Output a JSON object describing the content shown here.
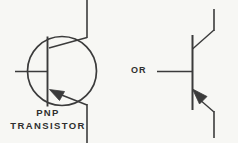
{
  "figure": {
    "kind": "schematic-diagram",
    "width": 238,
    "height": 143,
    "background_color": "#f7f7f4",
    "line_color": "#3b3b3b",
    "text_color": "#2f2f2f"
  },
  "labels": {
    "caption_line1": "PNP",
    "caption_line2": "TRANSISTOR",
    "alternative_connector": "OR"
  },
  "symbols": [
    {
      "name": "pnp-transistor-enclosed",
      "has_envelope_circle": true,
      "circle": {
        "cx": 62,
        "cy": 71,
        "r": 35
      },
      "base_bar": {
        "x": 47,
        "y1": 36,
        "y2": 107
      },
      "base_lead": {
        "x1": 15,
        "y1": 71,
        "x2": 47,
        "y2": 71
      },
      "collector": {
        "slant": {
          "x1": 50,
          "y1": 47,
          "x2": 87,
          "y2": 37
        },
        "lead": {
          "x": 87,
          "y1": 0,
          "y2": 37
        }
      },
      "emitter": {
        "slant": {
          "x1": 50,
          "y1": 95,
          "x2": 87,
          "y2": 105
        },
        "lead": {
          "x": 87,
          "y1": 105,
          "y2": 143
        },
        "arrow_points_toward": "base"
      }
    },
    {
      "name": "pnp-transistor-plain",
      "has_envelope_circle": false,
      "base_bar": {
        "x": 192,
        "y1": 35,
        "y2": 110
      },
      "base_lead": {
        "x1": 157,
        "y1": 71,
        "x2": 192,
        "y2": 71
      },
      "collector": {
        "slant": {
          "x1": 192,
          "y1": 48,
          "x2": 214,
          "y2": 30
        },
        "lead": {
          "x": 214,
          "y1": 9,
          "y2": 30
        }
      },
      "emitter": {
        "slant": {
          "x1": 192,
          "y1": 94,
          "x2": 214,
          "y2": 112
        },
        "lead": {
          "x": 214,
          "y1": 112,
          "y2": 138
        },
        "arrow_points_toward": "base"
      }
    }
  ]
}
